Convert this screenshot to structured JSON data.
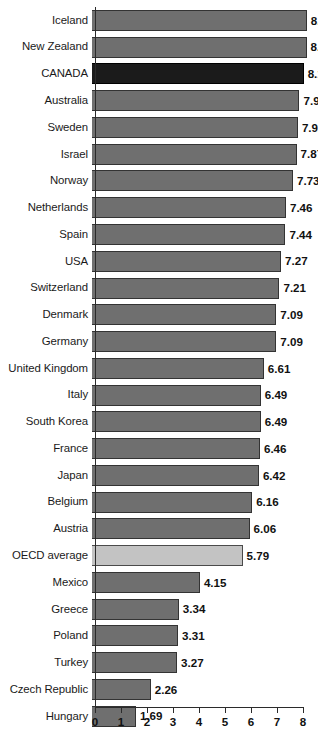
{
  "chart_data": {
    "type": "bar",
    "orientation": "horizontal",
    "title": "",
    "subtitle": "",
    "xlabel": "",
    "ylabel": "",
    "xlim": [
      0,
      8
    ],
    "xticks": [
      0,
      1,
      2,
      3,
      4,
      5,
      6,
      7,
      8
    ],
    "xtick_labels": [
      "0",
      "1",
      "2",
      "3",
      "4",
      "5",
      "6",
      "7",
      "8"
    ],
    "grid": false,
    "legend": false,
    "legend_position": "none",
    "colors": {
      "bar_default": "#6f6f6f",
      "bar_highlight": "#1b1b1b",
      "bar_average": "#c3c3c3",
      "bar_border": "#333333",
      "axis": "#2b2b2b",
      "text": "#111111",
      "background": "#ffffff"
    },
    "categories": [
      "Iceland",
      "New Zealand",
      "CANADA",
      "Australia",
      "Sweden",
      "Israel",
      "Norway",
      "Netherlands",
      "Spain",
      "USA",
      "Switzerland",
      "Denmark",
      "Germany",
      "United Kingdom",
      "Italy",
      "South Korea",
      "France",
      "Japan",
      "Belgium",
      "Austria",
      "OECD average",
      "Mexico",
      "Greece",
      "Poland",
      "Turkey",
      "Czech Republic",
      "Hungary"
    ],
    "values": [
      8.26,
      8.25,
      8.14,
      7.98,
      7.92,
      7.87,
      7.73,
      7.46,
      7.44,
      7.27,
      7.21,
      7.09,
      7.09,
      6.61,
      6.49,
      6.49,
      6.46,
      6.42,
      6.16,
      6.06,
      5.79,
      4.15,
      3.34,
      3.31,
      3.27,
      2.26,
      1.69
    ],
    "value_labels": [
      "8.26",
      "8.25",
      "8.14",
      "7.98",
      "7.92",
      "7.87",
      "7.73",
      "7.46",
      "7.44",
      "7.27",
      "7.21",
      "7.09",
      "7.09",
      "6.61",
      "6.49",
      "6.49",
      "6.46",
      "6.42",
      "6.16",
      "6.06",
      "5.79",
      "4.15",
      "3.34",
      "3.31",
      "3.27",
      "2.26",
      "1.69"
    ],
    "bars": [
      {
        "label": "Iceland",
        "value": 8.26,
        "value_label": "8.26",
        "style": "default"
      },
      {
        "label": "New Zealand",
        "value": 8.25,
        "value_label": "8.25",
        "style": "default"
      },
      {
        "label": "CANADA",
        "value": 8.14,
        "value_label": "8.14",
        "style": "highlight"
      },
      {
        "label": "Australia",
        "value": 7.98,
        "value_label": "7.98",
        "style": "default"
      },
      {
        "label": "Sweden",
        "value": 7.92,
        "value_label": "7.92",
        "style": "default"
      },
      {
        "label": "Israel",
        "value": 7.87,
        "value_label": "7.87",
        "style": "default"
      },
      {
        "label": "Norway",
        "value": 7.73,
        "value_label": "7.73",
        "style": "default"
      },
      {
        "label": "Netherlands",
        "value": 7.46,
        "value_label": "7.46",
        "style": "default"
      },
      {
        "label": "Spain",
        "value": 7.44,
        "value_label": "7.44",
        "style": "default"
      },
      {
        "label": "USA",
        "value": 7.27,
        "value_label": "7.27",
        "style": "default"
      },
      {
        "label": "Switzerland",
        "value": 7.21,
        "value_label": "7.21",
        "style": "default"
      },
      {
        "label": "Denmark",
        "value": 7.09,
        "value_label": "7.09",
        "style": "default"
      },
      {
        "label": "Germany",
        "value": 7.09,
        "value_label": "7.09",
        "style": "default"
      },
      {
        "label": "United Kingdom",
        "value": 6.61,
        "value_label": "6.61",
        "style": "default"
      },
      {
        "label": "Italy",
        "value": 6.49,
        "value_label": "6.49",
        "style": "default"
      },
      {
        "label": "South Korea",
        "value": 6.49,
        "value_label": "6.49",
        "style": "default"
      },
      {
        "label": "France",
        "value": 6.46,
        "value_label": "6.46",
        "style": "default"
      },
      {
        "label": "Japan",
        "value": 6.42,
        "value_label": "6.42",
        "style": "default"
      },
      {
        "label": "Belgium",
        "value": 6.16,
        "value_label": "6.16",
        "style": "default"
      },
      {
        "label": "Austria",
        "value": 6.06,
        "value_label": "6.06",
        "style": "default"
      },
      {
        "label": "OECD average",
        "value": 5.79,
        "value_label": "5.79",
        "style": "average"
      },
      {
        "label": "Mexico",
        "value": 4.15,
        "value_label": "4.15",
        "style": "default"
      },
      {
        "label": "Greece",
        "value": 3.34,
        "value_label": "3.34",
        "style": "default"
      },
      {
        "label": "Poland",
        "value": 3.31,
        "value_label": "3.31",
        "style": "default"
      },
      {
        "label": "Turkey",
        "value": 3.27,
        "value_label": "3.27",
        "style": "default"
      },
      {
        "label": "Czech Republic",
        "value": 2.26,
        "value_label": "2.26",
        "style": "default"
      },
      {
        "label": "Hungary",
        "value": 1.69,
        "value_label": "1.69",
        "style": "default"
      }
    ]
  }
}
